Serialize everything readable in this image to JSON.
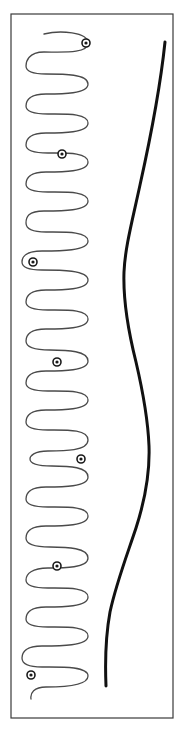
{
  "figure": {
    "canvas": {
      "width": 185,
      "height": 737
    },
    "background_color": "#ffffff"
  },
  "frame": {
    "name": "plot-border",
    "x": 11,
    "y": 14,
    "width": 162,
    "height": 704,
    "stroke_color": "#3a3a3a",
    "stroke_width": 1.2
  },
  "serpentine": {
    "label": "serpentine-trace",
    "stroke_color": "#4a4a4a",
    "stroke_width": 1.3,
    "description": "Tightly folded meander / switchback trace running top to bottom on the left half of the frame",
    "fold_count": 29,
    "x_left": 26,
    "x_right": 88,
    "y_start": 34,
    "y_end": 700,
    "path": "M 44 34 C 60 30 88 32 88 43 C 88 54 62 52 44 52 C 28 52 26 62 26 66 C 26 71 32 74 46 74 C 64 74 88 74 88 84 C 88 94 62 94 46 94 C 30 94 26 100 26 106 C 26 112 34 114 48 114 C 66 114 88 113 88 123 C 88 133 62 133 46 133 C 30 133 26 139 26 145 C 26 151 34 153 48 153 C 66 153 88 152 88 162 C 88 172 62 172 46 172 C 30 172 26 178 26 184 C 26 190 34 192 48 192 C 66 192 88 191 88 201 C 88 211 62 211 44 211 C 28 211 26 217 26 223 C 26 229 32 232 46 232 C 64 232 88 231 88 241 C 88 251 60 251 42 251 C 26 251 22 257 22 262 C 22 267 28 270 42 270 C 60 270 88 270 88 280 C 88 290 62 290 46 290 C 30 290 26 296 26 302 C 26 308 34 310 48 310 C 66 310 88 309 88 319 C 88 329 62 329 46 329 C 30 329 26 335 26 341 C 26 347 34 350 50 350 C 68 350 88 351 88 361 C 88 371 62 371 46 371 C 30 371 26 377 26 383 C 26 389 34 391 48 391 C 66 391 88 390 88 400 C 88 410 62 410 46 410 C 30 410 26 416 26 422 C 26 428 34 430 48 430 C 66 430 88 429 88 440 C 88 451 64 451 48 451 C 34 451 30 456 30 459 C 30 463 36 466 52 466 C 70 466 88 467 88 477 C 88 487 62 487 46 487 C 30 487 26 493 26 499 C 26 505 34 507 48 507 C 66 507 88 506 88 516 C 88 526 62 526 46 526 C 30 526 26 532 26 538 C 26 544 34 547 50 547 C 68 547 88 548 88 558 C 88 568 64 568 48 568 C 32 568 26 574 26 580 C 26 586 34 588 48 588 C 66 588 88 587 88 597 C 88 607 62 607 46 607 C 30 607 26 613 26 619 C 26 625 34 627 48 627 C 66 627 88 626 88 636 C 88 646 60 646 42 646 C 26 646 22 652 22 658 C 22 664 28 667 42 667 C 60 667 88 666 88 676 C 88 686 62 687 46 687 C 34 687 30 693 31 699"
  },
  "smooth_curve": {
    "label": "envelope-curve",
    "stroke_color": "#111111",
    "stroke_width": 3.0,
    "description": "Thick smooth S-shaped curve on the right half of the frame",
    "y_start": 42,
    "y_end": 686,
    "x_min": 122,
    "x_max": 166,
    "path": "M 165 42 C 160 90 150 140 140 185 C 132 222 125 248 124 272 C 123 300 128 330 136 362 C 143 392 148 420 149 446 C 150 474 145 500 136 528 C 126 558 116 584 110 612 C 106 634 105 662 106 686",
    "sampled_points": [
      {
        "x": 165,
        "y": 42
      },
      {
        "x": 152,
        "y": 120
      },
      {
        "x": 136,
        "y": 196
      },
      {
        "x": 124,
        "y": 272
      },
      {
        "x": 136,
        "y": 362
      },
      {
        "x": 149,
        "y": 446
      },
      {
        "x": 136,
        "y": 528
      },
      {
        "x": 116,
        "y": 600
      },
      {
        "x": 106,
        "y": 686
      }
    ]
  },
  "markers": {
    "label": "event-markers",
    "style": "bullseye",
    "outer_radius": 4.0,
    "inner_radius": 1.6,
    "outer_stroke_color": "#1a1a1a",
    "outer_fill_color": "#ffffff",
    "inner_fill_color": "#1a1a1a",
    "count": 7,
    "points": [
      {
        "id": "marker-1",
        "x": 86,
        "y": 43
      },
      {
        "id": "marker-2",
        "x": 62,
        "y": 154
      },
      {
        "id": "marker-3",
        "x": 33,
        "y": 262
      },
      {
        "id": "marker-4",
        "x": 57,
        "y": 362
      },
      {
        "id": "marker-5",
        "x": 81,
        "y": 459
      },
      {
        "id": "marker-6",
        "x": 57,
        "y": 566
      },
      {
        "id": "marker-7",
        "x": 31,
        "y": 675
      }
    ]
  },
  "chart_data": {
    "type": "line",
    "xlabel": "",
    "ylabel": "",
    "xlim": [
      11,
      173
    ],
    "ylim": [
      14,
      718
    ],
    "grid": false,
    "legend": "none",
    "series": [
      {
        "name": "serpentine-trace",
        "style": "thin-meander",
        "color": "#4a4a4a",
        "fold_count": 29,
        "x_range": [
          26,
          88
        ],
        "y_range": [
          34,
          700
        ]
      },
      {
        "name": "envelope-curve",
        "style": "thick-smooth",
        "color": "#111111",
        "x": [
          165,
          152,
          136,
          124,
          136,
          149,
          136,
          116,
          106
        ],
        "y": [
          42,
          120,
          196,
          272,
          362,
          446,
          528,
          600,
          686
        ]
      },
      {
        "name": "event-markers",
        "style": "bullseye-points",
        "color": "#1a1a1a",
        "x": [
          86,
          62,
          33,
          57,
          81,
          57,
          31
        ],
        "y": [
          43,
          154,
          262,
          362,
          459,
          566,
          675
        ]
      }
    ]
  }
}
